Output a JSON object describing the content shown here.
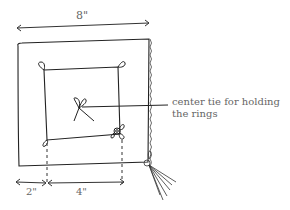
{
  "diagram": {
    "dimensions": {
      "overall_width": "8\"",
      "border_width": "2\"",
      "inner_width": "4\""
    },
    "annotation": {
      "line1": "center tie for holding",
      "line2": "the rings"
    },
    "colors": {
      "stroke": "#222222",
      "text": "#666666",
      "background": "#ffffff"
    }
  }
}
